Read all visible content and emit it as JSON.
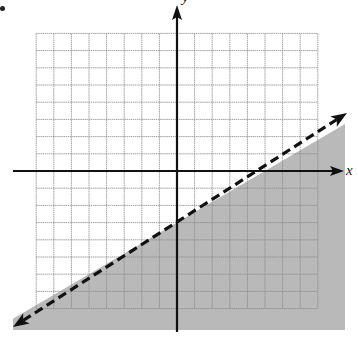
{
  "chart_data": {
    "type": "inequality-graph",
    "title": "",
    "xlabel": "x",
    "ylabel": "y",
    "grid": true,
    "grid_unit": 1,
    "xlim": [
      -8,
      8
    ],
    "ylim": [
      -8,
      8
    ],
    "boundary_line": {
      "equation": "y = (3/5)x - 3",
      "slope": 0.6,
      "y_intercept": -3,
      "x_intercept": 5,
      "style": "dashed",
      "arrows": "both"
    },
    "inequality": "y < (3/5)x - 3",
    "shaded_region": "below line",
    "colors": {
      "shade": "#b9b9b9",
      "grid": "#8a8a8a",
      "axis": "#111111",
      "line": "#111111"
    }
  },
  "labels": {
    "x_axis": "x",
    "y_axis": "y"
  }
}
